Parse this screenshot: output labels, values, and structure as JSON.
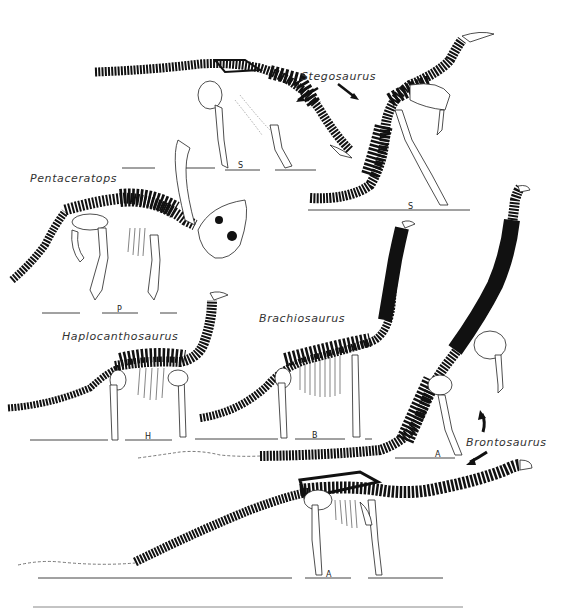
{
  "figure": {
    "labels": {
      "stegosaurus": "Stegosaurus",
      "pentaceratops": "Pentaceratops",
      "haplocanthosaurus": "Haplocanthosaurus",
      "brachiosaurus": "Brachiosaurus",
      "brontosaurus": "Brontosaurus"
    },
    "scale_letters": {
      "stegosaurus_a": "S",
      "stegosaurus_b": "S",
      "pentaceratops": "P",
      "haplocanthosaurus": "H",
      "brachiosaurus": "B",
      "brontosaurus_a": "A",
      "brontosaurus_b": "A"
    },
    "colors": {
      "ink": "#111111",
      "paper": "#ffffff",
      "line": "#444444"
    }
  }
}
